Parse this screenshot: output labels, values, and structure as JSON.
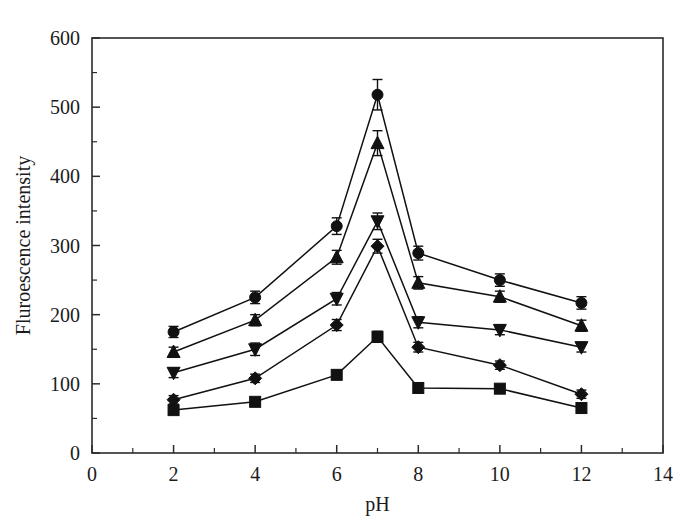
{
  "chart_data": {
    "type": "line",
    "title": "",
    "xlabel": "pH",
    "ylabel": "Fluroescence intensity",
    "x": [
      2,
      4,
      6,
      7,
      8,
      10,
      12
    ],
    "xlim": [
      0,
      14
    ],
    "ylim": [
      0,
      600
    ],
    "xticks": [
      0,
      2,
      4,
      6,
      8,
      10,
      12,
      14
    ],
    "yticks": [
      0,
      100,
      200,
      300,
      400,
      500,
      600
    ],
    "x_minor_ticks": [
      1,
      3,
      5,
      7,
      9,
      11,
      13
    ],
    "y_minor_ticks": [
      50,
      150,
      250,
      350,
      450,
      550
    ],
    "grid": false,
    "legend": "none",
    "error_bars": true,
    "series": [
      {
        "name": "series-1",
        "marker": "circle",
        "values": [
          175,
          225,
          328,
          518,
          289,
          250,
          217
        ],
        "errors": [
          8,
          9,
          12,
          22,
          10,
          9,
          9
        ]
      },
      {
        "name": "series-2",
        "marker": "triangle-up",
        "values": [
          146,
          192,
          283,
          448,
          246,
          226,
          184
        ],
        "errors": [
          7,
          8,
          10,
          18,
          9,
          8,
          8
        ]
      },
      {
        "name": "series-3",
        "marker": "triangle-down",
        "values": [
          116,
          150,
          223,
          335,
          189,
          178,
          153
        ],
        "errors": [
          7,
          9,
          9,
          12,
          8,
          7,
          7
        ]
      },
      {
        "name": "series-4",
        "marker": "diamond",
        "values": [
          77,
          108,
          185,
          299,
          153,
          127,
          85
        ],
        "errors": [
          6,
          6,
          8,
          10,
          7,
          6,
          6
        ]
      },
      {
        "name": "series-5",
        "marker": "square",
        "values": [
          62,
          74,
          113,
          168,
          94,
          93,
          65
        ],
        "errors": [
          5,
          5,
          6,
          8,
          5,
          5,
          5
        ]
      }
    ]
  },
  "axes": {
    "x_tick_labels": [
      "0",
      "2",
      "4",
      "6",
      "8",
      "10",
      "12",
      "14"
    ],
    "y_tick_labels": [
      "0",
      "100",
      "200",
      "300",
      "400",
      "500",
      "600"
    ],
    "x_axis_title": "pH",
    "y_axis_title": "Fluroescence intensity"
  }
}
